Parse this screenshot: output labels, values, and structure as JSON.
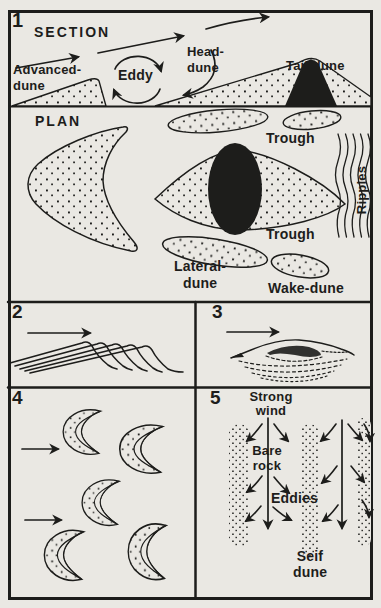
{
  "figure_title": "Dune formation diagram",
  "colors": {
    "paper": "#eae8e3",
    "ink": "#1d1d1b"
  },
  "panel1": {
    "number": "1",
    "section_title": "SECTION",
    "plan_title": "PLAN",
    "advanced_dune": "Advanced-\ndune",
    "eddy": "Eddy",
    "head_dune": "Head-\ndune",
    "tail_dune": "Tail-dune",
    "trough_upper": "Trough",
    "ripples": "Ripples",
    "trough_lower": "Trough",
    "lateral_dune": "Lateral-\ndune",
    "wake_dune": "Wake-dune"
  },
  "panel2": {
    "number": "2"
  },
  "panel3": {
    "number": "3"
  },
  "panel4": {
    "number": "4"
  },
  "panel5": {
    "number": "5",
    "strong_wind": "Strong\nwind",
    "bare_rock": "Bare\nrock",
    "eddies": "Eddies",
    "seif_dune": "Seif\ndune"
  }
}
